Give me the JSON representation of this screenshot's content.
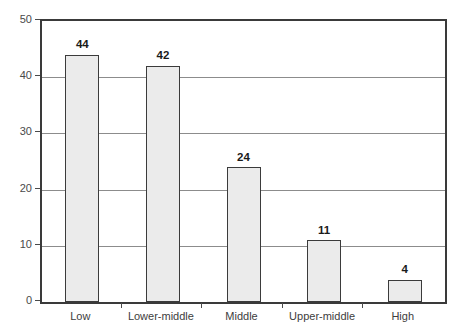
{
  "chart_data": {
    "type": "bar",
    "title": "",
    "subtitle": "",
    "xlabel": "",
    "ylabel": "",
    "categories": [
      "Low",
      "Lower-middle",
      "Middle",
      "Upper-middle",
      "High"
    ],
    "values": [
      44,
      42,
      24,
      11,
      4
    ],
    "value_labels": [
      "44",
      "42",
      "24",
      "11",
      "4"
    ],
    "ylim": [
      0,
      50
    ],
    "ytick_labels": [
      "0",
      "10",
      "20",
      "30",
      "40",
      "50"
    ],
    "ytick_values": [
      0,
      10,
      20,
      30,
      40,
      50
    ],
    "grid": true,
    "grid_axis": "y",
    "legend": false,
    "legend_position": "none",
    "colors": {
      "bar_fill": "#ebebeb",
      "bar_border": "#3b3b3b",
      "gridline": "#8c8c8c",
      "axis": "#3a3a3a",
      "tick_text": "#4a4a4a",
      "value_text": "#1a1a1a",
      "background": "#ffffff"
    }
  }
}
